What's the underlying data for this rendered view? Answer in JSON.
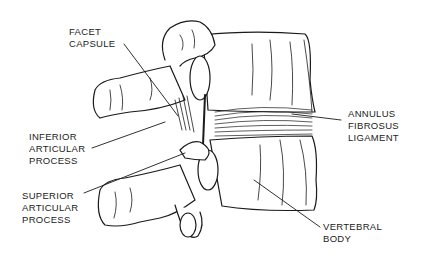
{
  "diagram": {
    "colors": {
      "line": "#1a1a1a",
      "background": "#ffffff"
    },
    "labels": [
      {
        "id": "facet-capsule",
        "lines": [
          "FACET",
          "CAPSULE"
        ]
      },
      {
        "id": "inferior-articular-process",
        "lines": [
          "INFERIOR",
          "ARTICULAR",
          "PROCESS"
        ]
      },
      {
        "id": "superior-articular-process",
        "lines": [
          "SUPERIOR",
          "ARTICULAR",
          "PROCESS"
        ]
      },
      {
        "id": "annulus-fibrosus-ligament",
        "lines": [
          "ANNULUS",
          "FIBROSUS",
          "LIGAMENT"
        ]
      },
      {
        "id": "vertebral-body",
        "lines": [
          "VERTEBRAL",
          "BODY"
        ]
      }
    ]
  }
}
